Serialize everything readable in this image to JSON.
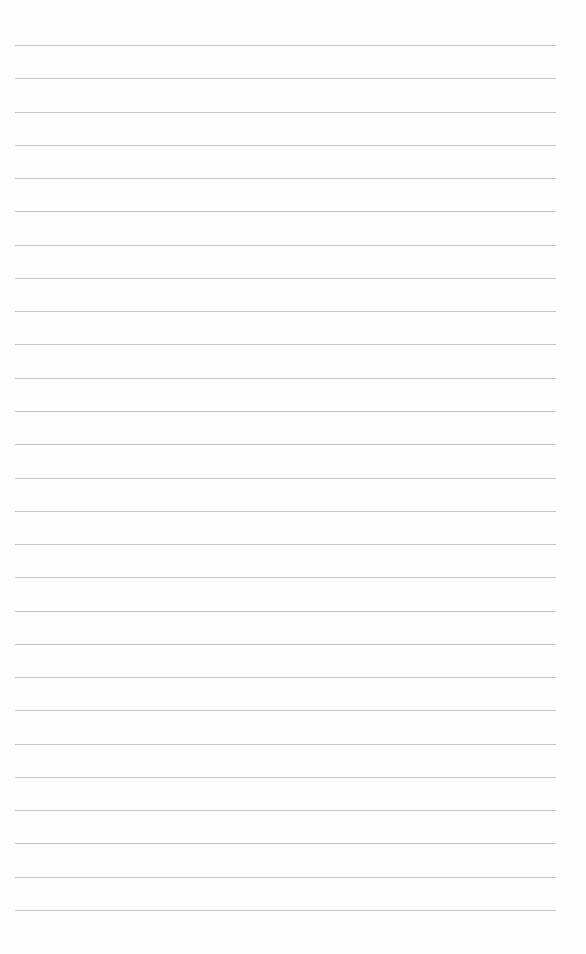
{
  "page": {
    "type": "blank lined paper",
    "background_color": "#fefefe",
    "line_color": "#c4c4c4",
    "line_count": 27,
    "first_line_y": 45,
    "line_spacing": 33.27,
    "line_left": 15,
    "line_right": 556
  }
}
